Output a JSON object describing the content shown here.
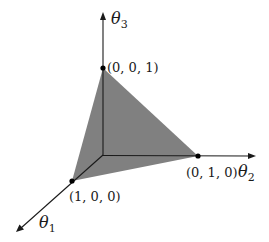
{
  "diagram": {
    "type": "probability-simplex-3d",
    "axes": [
      {
        "id": "theta1",
        "label": "θ",
        "subscript": "1"
      },
      {
        "id": "theta2",
        "label": "θ",
        "subscript": "2"
      },
      {
        "id": "theta3",
        "label": "θ",
        "subscript": "3"
      }
    ],
    "vertices": [
      {
        "id": "v100",
        "label": "(1, 0, 0)"
      },
      {
        "id": "v010",
        "label": "(0, 1, 0)"
      },
      {
        "id": "v001",
        "label": "(0, 0, 1)"
      }
    ],
    "colors": {
      "simplex_fill": "#808080",
      "axis": "#1a1a1a",
      "background": "#ffffff"
    }
  }
}
